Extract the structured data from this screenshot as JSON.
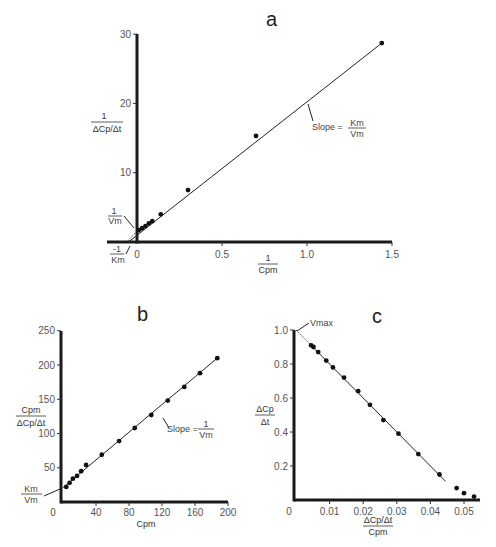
{
  "figure": {
    "panels": [
      "a",
      "b",
      "c"
    ]
  },
  "chart_data": [
    {
      "panel": "a",
      "type": "scatter",
      "title": "a",
      "xlabel": "1 / Cpm",
      "ylabel": "1 / (ΔCp/Δt)",
      "xlabel_num": "1",
      "xlabel_den": "Cpm",
      "ylabel_num": "1",
      "ylabel_den": "ΔCp/Δt",
      "xlim": [
        -0.18,
        1.5
      ],
      "ylim": [
        0,
        30
      ],
      "xticks": [
        0,
        0.5,
        1.0,
        1.5
      ],
      "xtick_labels": [
        "0",
        "0.5",
        "1.0",
        "1.5"
      ],
      "yticks": [
        10,
        20,
        30
      ],
      "ytick_labels": [
        "10",
        "20",
        "30"
      ],
      "grid": false,
      "legend": null,
      "fit_line": {
        "x0": -0.05,
        "y0": 0,
        "x1": 1.44,
        "y1": 28.7,
        "extrapolated_dashed_from": -0.05,
        "extrapolated_dashed_to": 0.0
      },
      "points": [
        {
          "x": 0.01,
          "y": 1.7
        },
        {
          "x": 0.03,
          "y": 2.0
        },
        {
          "x": 0.05,
          "y": 2.3
        },
        {
          "x": 0.07,
          "y": 2.7
        },
        {
          "x": 0.09,
          "y": 3.0
        },
        {
          "x": 0.14,
          "y": 4.0
        },
        {
          "x": 0.3,
          "y": 7.5
        },
        {
          "x": 0.7,
          "y": 15.3
        },
        {
          "x": 1.44,
          "y": 28.7
        }
      ],
      "annotations": [
        {
          "text": "Slope =",
          "frac_num": "Km",
          "frac_den": "Vm",
          "label": "Slope = Km/Vm"
        },
        {
          "text": "",
          "frac_num": "1",
          "frac_den": "Vm",
          "label": "1/Vm (y-intercept)"
        },
        {
          "text": "",
          "frac_num": "-1",
          "frac_den": "Km",
          "label": "-1/Km (x-intercept)"
        }
      ]
    },
    {
      "panel": "b",
      "type": "scatter",
      "title": "b",
      "xlabel": "Cpm",
      "ylabel": "Cpm / (ΔCp/Δt)",
      "ylabel_num": "Cpm",
      "ylabel_den": "ΔCp/Δt",
      "xlim": [
        0,
        200
      ],
      "ylim": [
        0,
        250
      ],
      "xticks": [
        0,
        40,
        80,
        120,
        160,
        200
      ],
      "xtick_labels": [
        "0",
        "40",
        "80",
        "120",
        "160",
        "200"
      ],
      "yticks": [
        50,
        100,
        150,
        200,
        250
      ],
      "ytick_labels": [
        "50",
        "100",
        "150",
        "200",
        "250"
      ],
      "grid": false,
      "legend": null,
      "fit_line": {
        "x0": 0,
        "y0": 21,
        "x1": 187,
        "y1": 210
      },
      "points": [
        {
          "x": 4,
          "y": 22
        },
        {
          "x": 8,
          "y": 28
        },
        {
          "x": 12,
          "y": 34
        },
        {
          "x": 17,
          "y": 38
        },
        {
          "x": 22,
          "y": 45
        },
        {
          "x": 28,
          "y": 54
        },
        {
          "x": 47,
          "y": 69
        },
        {
          "x": 68,
          "y": 89
        },
        {
          "x": 87,
          "y": 108
        },
        {
          "x": 107,
          "y": 127
        },
        {
          "x": 127,
          "y": 148
        },
        {
          "x": 147,
          "y": 168
        },
        {
          "x": 166,
          "y": 188
        },
        {
          "x": 187,
          "y": 210
        }
      ],
      "annotations": [
        {
          "text": "Slope =",
          "frac_num": "1",
          "frac_den": "Vm",
          "label": "Slope = 1/Vm"
        },
        {
          "text": "",
          "frac_num": "Km",
          "frac_den": "Vm",
          "label": "Km/Vm (y-intercept)"
        }
      ]
    },
    {
      "panel": "c",
      "type": "scatter",
      "title": "c",
      "xlabel": "(ΔCp/Δt) / Cpm",
      "ylabel": "ΔCp / Δt",
      "xlabel_num": "ΔCp/Δt",
      "xlabel_den": "Cpm",
      "ylabel_num": "ΔCp",
      "ylabel_den": "Δt",
      "xlim": [
        0,
        0.055
      ],
      "ylim": [
        0,
        1.0
      ],
      "xticks": [
        0,
        0.01,
        0.02,
        0.03,
        0.04,
        0.05
      ],
      "xtick_labels": [
        "0",
        "0.01",
        "0.02",
        "0.03",
        "0.04",
        "0.05"
      ],
      "yticks": [
        0.2,
        0.4,
        0.6,
        0.8,
        1.0
      ],
      "ytick_labels": [
        "0.2",
        "0.4",
        "0.6",
        "0.8",
        "1.0"
      ],
      "grid": false,
      "legend": null,
      "fit_line": {
        "x0": 0.0045,
        "y0": 0.91,
        "x1": 0.0445,
        "y1": 0.11,
        "extrapolated_dashed_from": 0.0,
        "extrapolated_dashed_to": 0.0045
      },
      "points": [
        {
          "x": 0.0045,
          "y": 0.91
        },
        {
          "x": 0.0052,
          "y": 0.9
        },
        {
          "x": 0.0066,
          "y": 0.87
        },
        {
          "x": 0.009,
          "y": 0.82
        },
        {
          "x": 0.011,
          "y": 0.78
        },
        {
          "x": 0.0143,
          "y": 0.72
        },
        {
          "x": 0.0185,
          "y": 0.64
        },
        {
          "x": 0.022,
          "y": 0.56
        },
        {
          "x": 0.026,
          "y": 0.47
        },
        {
          "x": 0.0305,
          "y": 0.39
        },
        {
          "x": 0.0364,
          "y": 0.27
        },
        {
          "x": 0.0427,
          "y": 0.15
        },
        {
          "x": 0.0478,
          "y": 0.07
        },
        {
          "x": 0.05,
          "y": 0.04
        },
        {
          "x": 0.053,
          "y": 0.02
        }
      ],
      "annotations": [
        {
          "text": "Vmax",
          "label": "Vmax (y-intercept)"
        }
      ]
    }
  ],
  "labels": {
    "a_title": "a",
    "b_title": "b",
    "c_title": "c",
    "a_slope_text": "Slope =",
    "a_slope_num": "Km",
    "a_slope_den": "Vm",
    "a_yint_num": "1",
    "a_yint_den": "Vm",
    "a_xint_num": "-1",
    "a_xint_den": "Km",
    "a_ylabel_num": "1",
    "a_ylabel_den": "ΔCp/Δt",
    "a_xlabel_num": "1",
    "a_xlabel_den": "Cpm",
    "b_slope_text": "Slope =",
    "b_slope_num": "1",
    "b_slope_den": "Vm",
    "b_yint_num": "Km",
    "b_yint_den": "Vm",
    "b_ylabel_num": "Cpm",
    "b_ylabel_den": "ΔCp/Δt",
    "b_xlabel": "Cpm",
    "c_vmax": "Vmax",
    "c_ylabel_num": "ΔCp",
    "c_ylabel_den": "Δt",
    "c_xlabel_num": "ΔCp/Δt",
    "c_xlabel_den": "Cpm"
  }
}
